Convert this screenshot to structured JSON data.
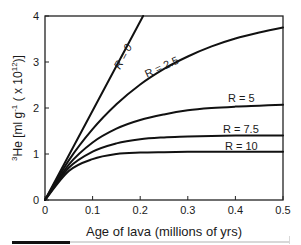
{
  "chart_data": {
    "type": "line",
    "title": "",
    "xlabel": "Age of lava (millions of yrs)",
    "ylabel": "³He [ml g⁻¹ ( x 10¹²)]",
    "ylabel_parts": {
      "pre_sup": "3",
      "main": "He [ml g",
      "sup1": "-1",
      "mid": " ( x 10",
      "sup2": "12",
      "post": ")]"
    },
    "xlim": [
      0,
      0.5
    ],
    "ylim": [
      0,
      4
    ],
    "xticks": [
      "0",
      "0.1",
      "0.2",
      "0.3",
      "0.4",
      "0.5"
    ],
    "xtick_values": [
      0,
      0.1,
      0.2,
      0.3,
      0.4,
      0.5
    ],
    "yticks": [
      "0",
      "1",
      "2",
      "3",
      "4"
    ],
    "ytick_values": [
      0,
      1,
      2,
      3,
      4
    ],
    "grid": false,
    "legend": "inline labels on curves",
    "x": [
      0,
      0.05,
      0.1,
      0.15,
      0.2,
      0.25,
      0.3,
      0.35,
      0.4,
      0.45,
      0.5
    ],
    "series": [
      {
        "name": "R = 0",
        "x": [
          0,
          0.206
        ],
        "values": [
          0,
          4.0
        ]
      },
      {
        "name": "R = 2.5",
        "values": [
          0,
          0.86,
          1.54,
          2.08,
          2.51,
          2.85,
          3.12,
          3.34,
          3.51,
          3.64,
          3.75
        ]
      },
      {
        "name": "R = 5",
        "values": [
          0,
          0.77,
          1.25,
          1.55,
          1.74,
          1.86,
          1.95,
          2.0,
          2.03,
          2.05,
          2.07
        ]
      },
      {
        "name": "R = 7.5",
        "values": [
          0,
          0.7,
          1.05,
          1.23,
          1.32,
          1.36,
          1.38,
          1.39,
          1.4,
          1.4,
          1.4
        ]
      },
      {
        "name": "R = 10",
        "values": [
          0,
          0.63,
          0.89,
          1.0,
          1.03,
          1.04,
          1.05,
          1.05,
          1.05,
          1.05,
          1.05
        ]
      }
    ]
  },
  "labels": {
    "r0": "R = 0",
    "r25": "R = 2.5",
    "r5": "R = 5",
    "r75": "R = 7.5",
    "r10": "R = 10"
  },
  "colors": {
    "line": "#111111",
    "axis": "#222222",
    "text": "#1a1a1a",
    "footer_black": "#111111",
    "footer_gray": "#d8d8d8"
  }
}
